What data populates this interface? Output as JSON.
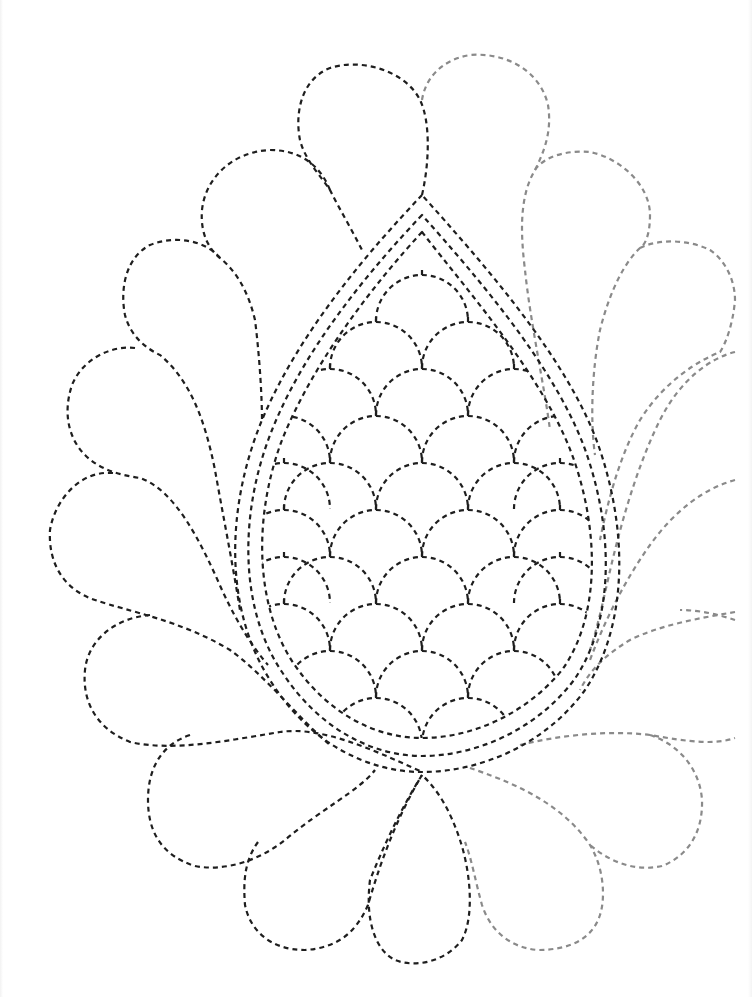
{
  "pattern": {
    "title": "",
    "background": "#ffffff",
    "colors": {
      "dark": "#1e1e1e",
      "light": "#8a8a8a"
    },
    "stroke": {
      "width": 2.2,
      "dash": "5 4"
    },
    "paisley": {
      "outer": "M 422 195 C 370 250, 300 330, 262 420 C 225 510, 225 610, 270 680 C 310 745, 370 772, 422 772 C 480 772, 545 745, 585 690 C 625 630, 630 540, 600 450 C 570 360, 480 260, 422 195 Z",
      "middle": "M 422 215 C 372 268, 306 345, 272 430 C 238 515, 240 610, 282 672 C 318 728, 372 756, 422 756 C 476 756, 536 730, 574 680 C 612 625, 615 540, 588 458 C 560 372, 478 278, 422 215 Z",
      "inner": "M 422 232 C 376 282, 314 360, 282 440 C 252 520, 256 608, 294 664 C 328 714, 376 738, 422 738 C 472 738, 526 714, 562 670 C 598 620, 600 540, 576 466 C 550 384, 470 294, 422 232 Z"
    },
    "scales": {
      "row_spacing": 47,
      "col_spacing": 92,
      "radius": 46,
      "rows": [
        {
          "y": 275,
          "xs": [
            422
          ]
        },
        {
          "y": 322,
          "xs": [
            376,
            468
          ]
        },
        {
          "y": 369,
          "xs": [
            330,
            422,
            514
          ]
        },
        {
          "y": 416,
          "xs": [
            284,
            376,
            468,
            560
          ]
        },
        {
          "y": 463,
          "xs": [
            284,
            330,
            422,
            514,
            560
          ]
        },
        {
          "y": 510,
          "xs": [
            284,
            376,
            468,
            560
          ]
        },
        {
          "y": 557,
          "xs": [
            284,
            330,
            422,
            514,
            560
          ]
        },
        {
          "y": 604,
          "xs": [
            284,
            376,
            468,
            560
          ]
        },
        {
          "y": 651,
          "xs": [
            330,
            422,
            514
          ]
        },
        {
          "y": 698,
          "xs": [
            376,
            468
          ]
        },
        {
          "y": 745,
          "xs": [
            422
          ]
        }
      ]
    },
    "feathers_left": [
      {
        "name": "feather-top-left-upper",
        "d": "M 422 195 C 430 160, 430 120, 420 100 C 405 70, 360 58, 330 68 C 300 80, 295 115, 300 140 C 305 160, 320 175, 330 190 C 340 210, 352 230, 362 250"
      },
      {
        "name": "feather-top-left-2",
        "d": "M 330 190 C 320 165, 300 150, 270 150 C 230 152, 205 180, 202 210 C 200 235, 210 250, 220 258 C 235 270, 248 290, 255 320 C 260 360, 262 400, 262 420"
      },
      {
        "name": "feather-left-3",
        "d": "M 220 258 C 205 240, 175 235, 150 245 C 125 258, 120 290, 125 315 C 130 335, 145 348, 160 355 C 190 380, 205 420, 215 470 C 222 510, 232 560, 240 610"
      },
      {
        "name": "feather-left-4",
        "d": "M 135 348 C 110 345, 82 360, 72 385 C 62 415, 70 440, 85 455 C 100 470, 120 475, 140 478 C 175 490, 200 540, 222 590 C 238 625, 255 650, 268 665"
      },
      {
        "name": "feather-left-5",
        "d": "M 113 473 C 80 470, 55 500, 50 530 C 48 565, 65 590, 95 600 C 130 612, 180 620, 230 650 C 265 675, 300 720, 330 745"
      },
      {
        "name": "feather-left-6",
        "d": "M 150 615 C 115 618, 88 640, 85 670 C 82 700, 95 728, 130 742 C 175 752, 230 740, 280 732 C 320 726, 370 748, 422 772"
      },
      {
        "name": "feather-bottom-left-1",
        "d": "M 190 735 C 160 745, 148 770, 148 800 C 148 830, 160 855, 195 866 C 225 872, 260 860, 285 840 C 320 810, 360 790, 375 770"
      },
      {
        "name": "feather-bottom-left-2",
        "d": "M 258 842 C 245 860, 243 880, 245 905 C 250 930, 270 950, 305 950 C 335 948, 355 935, 368 905 C 378 870, 395 820, 422 775"
      },
      {
        "name": "feather-bottom-center",
        "d": "M 422 775 C 400 810, 382 850, 370 880 C 365 920, 375 950, 395 960 C 415 968, 445 962, 462 940 C 475 915, 470 870, 460 840 C 450 810, 438 790, 422 775"
      }
    ],
    "feathers_right": [
      {
        "name": "feather-top-right-upper",
        "d": "M 422 100 C 425 80, 440 60, 470 55 C 505 52, 540 70, 548 105 C 552 130, 545 150, 535 170 C 520 195, 520 230, 525 270 C 530 320, 545 390, 550 430"
      },
      {
        "name": "feather-top-right-2",
        "d": "M 535 170 C 545 155, 570 150, 590 152 C 620 158, 650 185, 650 215 C 650 235, 645 245, 640 248 C 625 262, 610 290, 600 330 C 592 370, 590 420, 595 455"
      },
      {
        "name": "feather-right-3",
        "d": "M 640 248 C 660 238, 690 240, 710 250 C 725 260, 735 280, 735 300 C 733 325, 725 345, 720 352 C 700 360, 665 380, 640 420 C 620 455, 608 500, 600 540"
      },
      {
        "name": "feather-right-4",
        "d": "M 735 352 C 710 358, 680 380, 660 420 C 640 460, 625 510, 615 550 C 605 590, 600 620, 590 650"
      },
      {
        "name": "feather-right-5",
        "d": "M 735 480 C 705 488, 675 510, 650 545 C 625 580, 605 620, 590 660"
      },
      {
        "name": "feather-right-6",
        "d": "M 735 612 C 700 618, 660 625, 630 640 C 605 655, 590 670, 580 690 M 735 620 C 720 615, 700 610, 680 610"
      },
      {
        "name": "feather-right-7",
        "d": "M 520 745 C 560 735, 610 730, 650 735 C 690 742, 715 745, 735 738 M 650 735 C 680 745, 700 770, 702 800 C 703 830, 690 855, 662 866 C 635 872, 610 862, 590 845"
      },
      {
        "name": "feather-right-8",
        "d": "M 470 768 C 505 780, 560 800, 590 845 C 605 870, 605 900, 600 915 C 592 940, 568 950, 538 950 C 510 948, 490 930, 482 905 C 475 880, 472 860, 465 842"
      }
    ]
  }
}
